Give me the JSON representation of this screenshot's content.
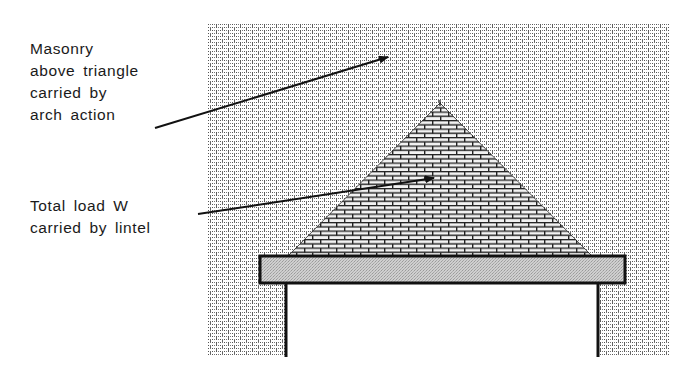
{
  "diagram": {
    "labels": {
      "masonry_arch": {
        "lines": [
          "Masonry",
          "above triangle",
          "carried by",
          "arch action"
        ]
      },
      "lintel_load": {
        "lines": [
          "Total load W",
          "carried by lintel"
        ]
      }
    },
    "elements": {
      "masonry_wall": {
        "x": 207,
        "y": 24,
        "width": 463,
        "height": 331,
        "fill": "dotted brick pattern"
      },
      "load_triangle": {
        "apex": [
          440,
          103
        ],
        "base_left": [
          288,
          256
        ],
        "base_right": [
          592,
          256
        ],
        "fill": "brick pattern"
      },
      "lintel": {
        "x": 260,
        "y": 256,
        "width": 365,
        "height": 27,
        "fill": "#c8c8c8"
      },
      "opening": {
        "left_x": 286,
        "right_x": 598,
        "top_y": 283,
        "bottom_y": 355
      }
    },
    "arrows": [
      {
        "from": [
          155,
          128
        ],
        "to": [
          388,
          57
        ],
        "target": "masonry above triangle"
      },
      {
        "from": [
          198,
          214
        ],
        "to": [
          434,
          178
        ],
        "target": "load triangle"
      }
    ],
    "colors": {
      "ink": "#111111",
      "lintel_fill": "#c8c8c8",
      "background": "#ffffff"
    }
  }
}
